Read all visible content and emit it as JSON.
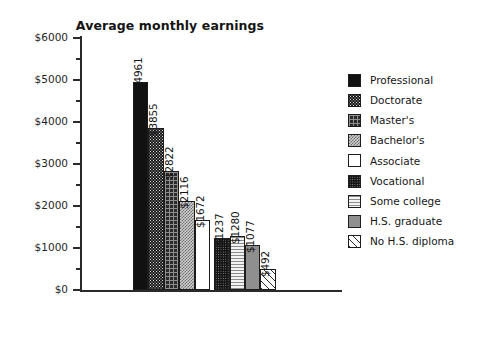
{
  "chart_data": {
    "type": "bar",
    "title": "Average monthly earnings",
    "xlabel": "",
    "ylabel": "",
    "ylim": [
      0,
      6000
    ],
    "grid": false,
    "legend_position": "right",
    "y_major_ticks": [
      "$0",
      "$1000",
      "$2000",
      "$3000",
      "$4000",
      "$5000",
      "$6000"
    ],
    "y_major_tick_values": [
      0,
      1000,
      2000,
      3000,
      4000,
      5000,
      6000
    ],
    "y_minor_tick_values": [
      500,
      1500,
      2500,
      3500,
      4500,
      5500
    ],
    "categories": [
      "Professional",
      "Doctorate",
      "Master's",
      "Bachelor's",
      "Associate",
      "Vocational",
      "Some college",
      "H.S. graduate",
      "No H.S. diploma"
    ],
    "values": [
      4961,
      3855,
      2822,
      2116,
      1672,
      1237,
      1280,
      1077,
      492
    ],
    "data_labels": [
      "$4961",
      "$3855",
      "$2822",
      "$2116",
      "$1672",
      "$1237",
      "$1280",
      "$1077",
      "$492"
    ],
    "bar_fills": [
      "solid-black",
      "dark-dots",
      "dark-grid",
      "grey-checker",
      "white",
      "black-dots",
      "light-horizontal-lines",
      "mid-grey",
      "diagonal-hatch"
    ],
    "colors": {
      "axis": "#2a2a2a",
      "text": "#141414",
      "background": "#ffffff",
      "bar_outline": "#1c1c1c"
    }
  },
  "legend": {
    "items": [
      {
        "label": "Professional",
        "fill": "solid-black"
      },
      {
        "label": "Doctorate",
        "fill": "dark-dots"
      },
      {
        "label": "Master's",
        "fill": "dark-grid"
      },
      {
        "label": "Bachelor's",
        "fill": "grey-checker"
      },
      {
        "label": "Associate",
        "fill": "white"
      },
      {
        "label": "Vocational",
        "fill": "black-dots"
      },
      {
        "label": "Some college",
        "fill": "light-horizontal-lines"
      },
      {
        "label": "H.S. graduate",
        "fill": "mid-grey"
      },
      {
        "label": "No H.S. diploma",
        "fill": "diagonal-hatch"
      }
    ]
  }
}
